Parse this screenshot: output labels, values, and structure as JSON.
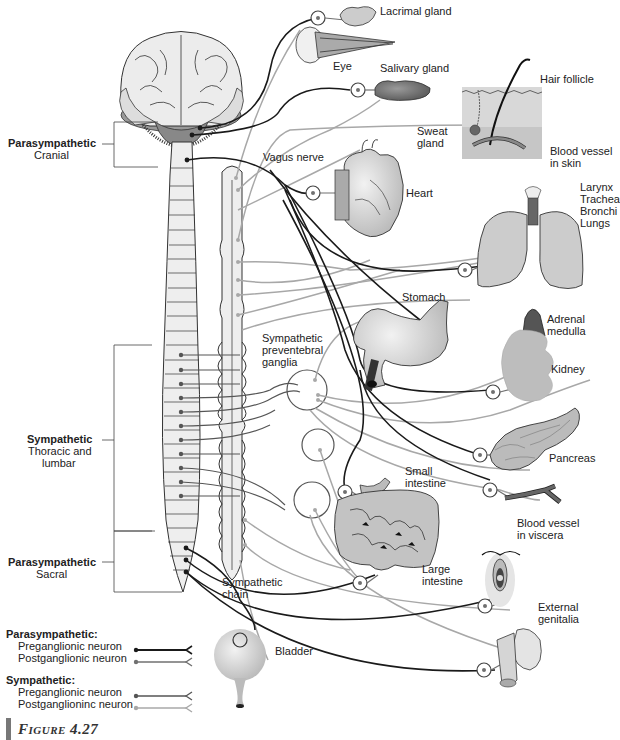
{
  "figure": {
    "label": "Figure 4.27"
  },
  "colors": {
    "para_pre": "#1a1a1a",
    "para_post": "#707070",
    "symp_pre": "#555555",
    "symp_post": "#a8a8a8",
    "organ_fill": "#c8c8c8",
    "cord_fill": "#eeeeee"
  },
  "divisions": {
    "cranial": {
      "title": "Parasympathetic",
      "subtitle": "Cranial"
    },
    "thoracolumbar": {
      "title": "Sympathetic",
      "subtitle1": "Thoracic and",
      "subtitle2": "lumbar"
    },
    "sacral": {
      "title": "Parasympathetic",
      "subtitle": "Sacral"
    }
  },
  "structures": {
    "vagus": "Vagus nerve",
    "preventebral1": "Sympathetic",
    "preventebral2": "preventebral",
    "preventebral3": "ganglia",
    "chain1": "Sympathetic",
    "chain2": "chain"
  },
  "organs": {
    "lacrimal": "Lacrimal gland",
    "eye": "Eye",
    "salivary": "Salivary gland",
    "hair": "Hair follicle",
    "sweat1": "Sweat",
    "sweat2": "gland",
    "vessel_skin1": "Blood vessel",
    "vessel_skin2": "in skin",
    "heart": "Heart",
    "larynx": "Larynx",
    "trachea": "Trachea",
    "bronchi": "Bronchi",
    "lungs": "Lungs",
    "stomach": "Stomach",
    "adrenal1": "Adrenal",
    "adrenal2": "medulla",
    "kidney": "Kidney",
    "pancreas": "Pancreas",
    "small1": "Small",
    "small2": "intestine",
    "vessel_visc1": "Blood vessel",
    "vessel_visc2": "in viscera",
    "large1": "Large",
    "large2": "intestine",
    "genitalia1": "External",
    "genitalia2": "genitalia",
    "bladder": "Bladder"
  },
  "legend": {
    "para_head": "Parasympathetic:",
    "para_pre": "Preganglionic neuron",
    "para_post": "Postganglionic neuron",
    "symp_head": "Sympathetic:",
    "symp_pre": "Preganglionic neuron",
    "symp_post": "Postganglioninc neuron"
  }
}
